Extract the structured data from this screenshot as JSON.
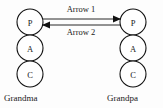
{
  "diagram": {
    "type": "node-link-diagram",
    "background_color": "#fdfdfd",
    "stroke_color": "#111111",
    "columns": [
      {
        "name": "grandma-column",
        "family_label": "Grandma",
        "center_x": 30,
        "label_x": 4,
        "label_y": 101,
        "nodes": [
          {
            "label": "P",
            "cx": 30,
            "cy": 22,
            "r": 13
          },
          {
            "label": "A",
            "cx": 30,
            "cy": 48,
            "r": 13
          },
          {
            "label": "C",
            "cx": 30,
            "cy": 74,
            "r": 13
          }
        ]
      },
      {
        "name": "grandpa-column",
        "family_label": "Grandpa",
        "center_x": 133,
        "label_x": 107,
        "label_y": 101,
        "nodes": [
          {
            "label": "P",
            "cx": 133,
            "cy": 22,
            "r": 13
          },
          {
            "label": "A",
            "cx": 133,
            "cy": 48,
            "r": 13
          },
          {
            "label": "C",
            "cx": 133,
            "cy": 74,
            "r": 13
          }
        ]
      }
    ],
    "arrows": [
      {
        "name": "arrow-1",
        "label": "Arrow 1",
        "direction": "right",
        "label_x": 81,
        "label_y": 12,
        "line_y": 19,
        "x_start": 43,
        "x_end": 120
      },
      {
        "name": "arrow-2",
        "label": "Arrow 2",
        "direction": "left",
        "label_x": 81,
        "label_y": 35,
        "line_y": 25,
        "x_start": 120,
        "x_end": 43
      }
    ]
  }
}
